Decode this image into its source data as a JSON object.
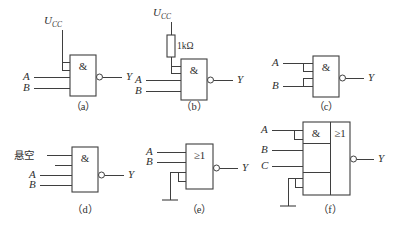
{
  "figure": {
    "title": "",
    "colors": {
      "line": "#3f3f3f",
      "text": "#2f2f2f",
      "background": "#ffffff"
    },
    "captions": {
      "a": "（a）",
      "b": "（b）",
      "c": "（c）",
      "d": "（d）",
      "e": "（e）",
      "f": "（f）"
    }
  },
  "labels": {
    "vcc": "U",
    "vcc_sub": "CC",
    "a": "A",
    "b": "B",
    "c": "C",
    "y": "Y",
    "and_symbol": "&",
    "or_symbol": "≥1",
    "resistor_value": "1kΩ",
    "floating": "悬空"
  },
  "circuits": [
    {
      "id": "a",
      "caption": "（a）",
      "gate": "NAND",
      "gate_symbol": "&",
      "inputs": [
        "U CC (tied to upper pin pair)",
        "A",
        "B"
      ],
      "output": "Y",
      "notes": "Unused inputs tied to Ucc"
    },
    {
      "id": "b",
      "caption": "（b）",
      "gate": "NAND",
      "gate_symbol": "&",
      "inputs": [
        "U CC through 1kΩ resistor",
        "A",
        "B"
      ],
      "output": "Y",
      "component": "1kΩ",
      "notes": "Unused inputs pulled up through 1kΩ"
    },
    {
      "id": "c",
      "caption": "（c）",
      "gate": "NAND",
      "gate_symbol": "&",
      "inputs": [
        "A (to two pins)",
        "B (to two pins)"
      ],
      "output": "Y",
      "notes": "Unused inputs paralleled with used inputs"
    },
    {
      "id": "d",
      "caption": "（d）",
      "gate": "NAND",
      "gate_symbol": "&",
      "inputs": [
        "悬空",
        "A",
        "B"
      ],
      "output": "Y",
      "notes": "Unused input left floating"
    },
    {
      "id": "e",
      "caption": "（e）",
      "gate": "NOR",
      "gate_symbol": "≥1",
      "inputs": [
        "A",
        "B",
        "grounded pin pair"
      ],
      "output": "Y",
      "notes": "Unused inputs grounded"
    },
    {
      "id": "f",
      "caption": "（f）",
      "gate": "AND-OR-INVERT",
      "gate_symbol_left": "&",
      "gate_symbol_right": "≥1",
      "inputs": [
        "A (to two pins)",
        "B",
        "C",
        "grounded pin pair"
      ],
      "output": "Y",
      "notes": "AND-OR-INVERT with unused AND group grounded"
    }
  ]
}
